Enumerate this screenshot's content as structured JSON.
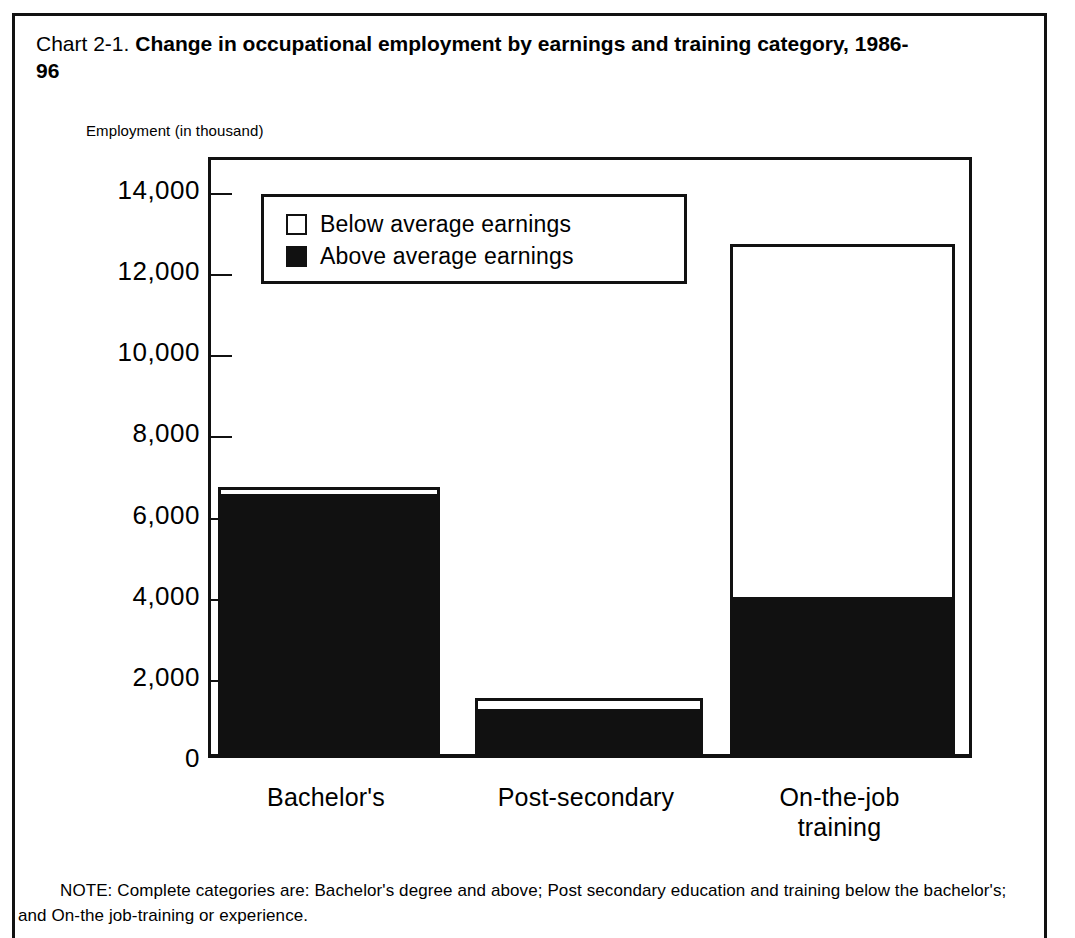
{
  "page": {
    "title_prefix": "Chart  2-1. ",
    "title_main": "Change in occupational employment by earnings and training category, 1986-96",
    "note": "NOTE: Complete categories are: Bachelor's degree and above; Post secondary education and training below the bachelor's; and On-the job-training or experience."
  },
  "legend": {
    "items": [
      {
        "label": "Below average earnings",
        "swatch": "white-square-icon",
        "color": "#ffffff"
      },
      {
        "label": "Above average earnings",
        "swatch": "black-square-icon",
        "color": "#111111"
      }
    ]
  },
  "chart_data": {
    "type": "bar",
    "stacked": true,
    "title": "Chart  2-1. Change in occupational employment by earnings and training category, 1986-96",
    "xlabel": "",
    "ylabel": "Employment (in thousand)",
    "ylim": [
      0,
      14800
    ],
    "grid": false,
    "legend_position": "top-left-inside",
    "categories": [
      "Bachelor's",
      "Post-secondary",
      "On-the-job training"
    ],
    "category_lines": [
      [
        "Bachelor's"
      ],
      [
        "Post-secondary"
      ],
      [
        "On-the-job",
        "training"
      ]
    ],
    "yticks": [
      0,
      2000,
      4000,
      6000,
      8000,
      10000,
      12000,
      14000
    ],
    "ytick_labels": [
      "0",
      "2,000",
      "4,000",
      "6,000",
      "8,000",
      "10,000",
      "12,000",
      "14,000"
    ],
    "series": [
      {
        "name": "Above average earnings",
        "color": "#111111",
        "values": [
          6420,
          1120,
          3880
        ]
      },
      {
        "name": "Below average earnings",
        "color": "#ffffff",
        "values": [
          160,
          260,
          8690
        ]
      }
    ],
    "totals": [
      6580,
      1380,
      12570
    ]
  }
}
